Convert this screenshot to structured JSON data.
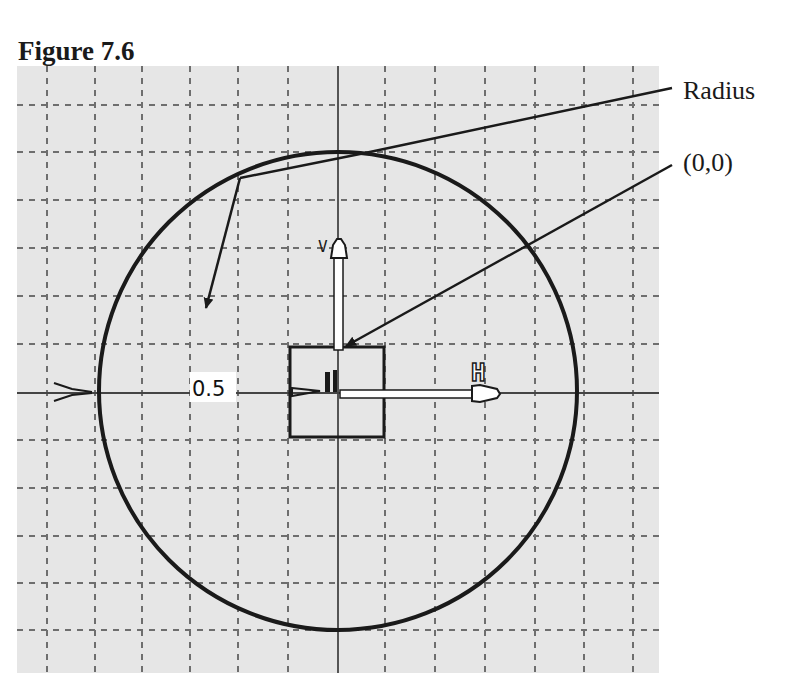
{
  "figure": {
    "title": "Figure 7.6"
  },
  "callouts": {
    "radius": "Radius",
    "origin": "(0,0)"
  },
  "sketch": {
    "dimension_value": "0.5",
    "horizontal_axis_label": "H",
    "vertical_axis_label": "V",
    "shape": "circle",
    "center": "(0,0)",
    "grid": "dashed",
    "colors": {
      "background": "#e6e6e6",
      "grid": "#6e6e6e",
      "stroke": "#1a1a1a",
      "axis": "#555555"
    }
  }
}
